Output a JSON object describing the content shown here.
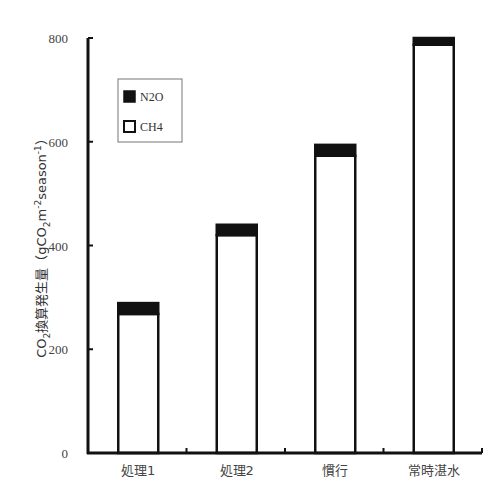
{
  "chart_data": {
    "type": "bar",
    "stacked": true,
    "title": "",
    "xlabel": "",
    "ylabel": "CO2換算発生量（gCO2m-2season-1）",
    "ylabel_parts": {
      "prefix": "CO",
      "sub1": "2",
      "middle": "換算発生量（gCO",
      "sub2": "2",
      "m": "m",
      "sup1": "-2",
      "season": "season",
      "sup2": "-1",
      "suffix": "）"
    },
    "ylim": [
      0,
      800
    ],
    "yticks": [
      0,
      200,
      400,
      600,
      800
    ],
    "grid": false,
    "legend_position": "upper-left",
    "categories": [
      "処理1",
      "処理2",
      "慣行",
      "常時湛水"
    ],
    "series": [
      {
        "name": "CH4",
        "color": "#ffffff",
        "values": [
          268,
          420,
          573,
          787
        ]
      },
      {
        "name": "N2O",
        "color": "#111111",
        "values": [
          21,
          20,
          21,
          13
        ]
      }
    ],
    "totals": [
      289,
      440,
      594,
      800
    ]
  },
  "legend": {
    "items": [
      {
        "label": "N2O",
        "swatch": "filled"
      },
      {
        "label": "CH4",
        "swatch": "hollow"
      }
    ]
  }
}
